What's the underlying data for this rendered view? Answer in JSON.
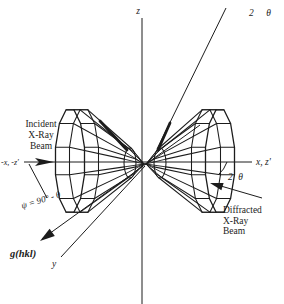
{
  "figure": {
    "background": "#ffffff",
    "ink": "#1c1c1c"
  },
  "labels": {
    "z_axis": "z",
    "x_axis_positive": "x, z'",
    "x_axis_negative": "-x, -z'",
    "y_axis": "y",
    "two_theta_top": "2 θ",
    "two_theta_mid": "2 θ",
    "psi_angle": "ψ = 90° - θ",
    "g_vector": "g(hkl)",
    "incident_beam": [
      "Incident",
      "X-Ray",
      "Beam"
    ],
    "diffracted_beam": [
      "Diffracted",
      "X-Ray",
      "Beam"
    ]
  }
}
